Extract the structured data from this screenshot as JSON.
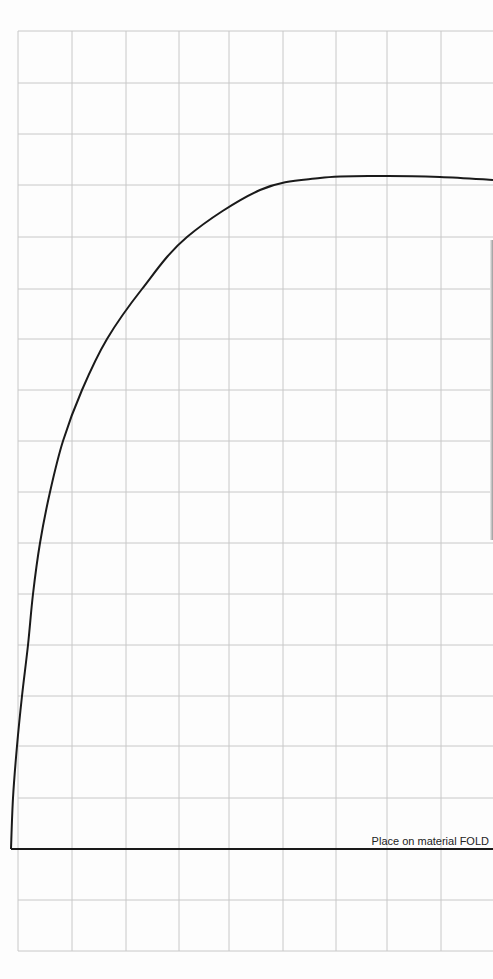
{
  "pattern": {
    "fold_label": "Place on material FOLD",
    "grid": {
      "line_color": "#c8c8c8",
      "vertical_x": [
        18,
        72,
        126,
        179,
        229,
        283,
        336,
        387,
        441
      ],
      "horizontal_y": [
        31,
        83,
        134,
        185,
        237,
        289,
        339,
        390,
        441,
        492,
        543,
        594,
        645,
        696,
        746,
        798,
        849,
        900,
        951
      ],
      "top": 31,
      "bottom": 951,
      "left": 18,
      "right": 493
    },
    "outline": {
      "color": "#1a1a1a",
      "curve_points": [
        [
          11,
          849
        ],
        [
          13,
          798
        ],
        [
          17,
          746
        ],
        [
          22,
          696
        ],
        [
          28,
          645
        ],
        [
          33,
          594
        ],
        [
          40,
          543
        ],
        [
          50,
          492
        ],
        [
          63,
          441
        ],
        [
          82,
          390
        ],
        [
          107,
          339
        ],
        [
          142,
          289
        ],
        [
          187,
          237
        ],
        [
          260,
          190
        ],
        [
          320,
          178
        ],
        [
          380,
          176
        ],
        [
          440,
          177
        ],
        [
          493,
          180
        ]
      ],
      "fold_line": {
        "x1": 11,
        "y1": 849,
        "x2": 493,
        "y2": 849
      }
    }
  }
}
